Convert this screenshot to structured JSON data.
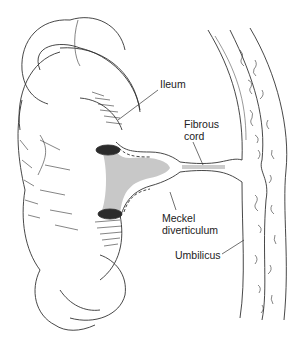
{
  "diagram": {
    "colors": {
      "line": "#333333",
      "ring_fill": "#2b2b2b",
      "lumen_fill": "#bdbdbd",
      "label_text": "#222222",
      "background": "#ffffff"
    },
    "labels": [
      {
        "id": "ileum",
        "text": "Ileum",
        "x": 160,
        "y": 84
      },
      {
        "id": "fibrous-cord",
        "text": "Fibrous\ncord",
        "x": 184,
        "y": 120
      },
      {
        "id": "meckel-diverticulum",
        "text": "Meckel\ndiverticulum",
        "x": 162,
        "y": 212
      },
      {
        "id": "umbilicus",
        "text": "Umbilicus",
        "x": 175,
        "y": 249
      }
    ],
    "structures": [
      "Ileum",
      "Fibrous cord",
      "Meckel diverticulum",
      "Umbilicus",
      "Abdominal wall"
    ]
  }
}
